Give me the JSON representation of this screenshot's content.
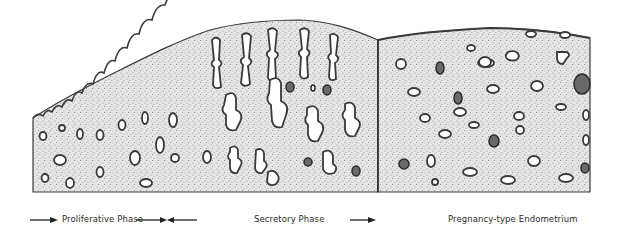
{
  "figure": {
    "colors": {
      "background": "#ffffff",
      "stroma": "#dcdcdc",
      "stroma_dots": "#8a8a8a",
      "gland_outline": "#3a3a3a",
      "gland_lumen": "#ffffff",
      "divider": "#222222",
      "text": "#2a2a2a"
    }
  },
  "legend": {
    "phases": [
      {
        "label": "Proliferative Phase",
        "arrow": "right"
      },
      {
        "label": "Secretory Phase",
        "arrow": "converging"
      },
      {
        "label": "Pregnancy-type Endometrium",
        "arrow": "right"
      }
    ]
  }
}
